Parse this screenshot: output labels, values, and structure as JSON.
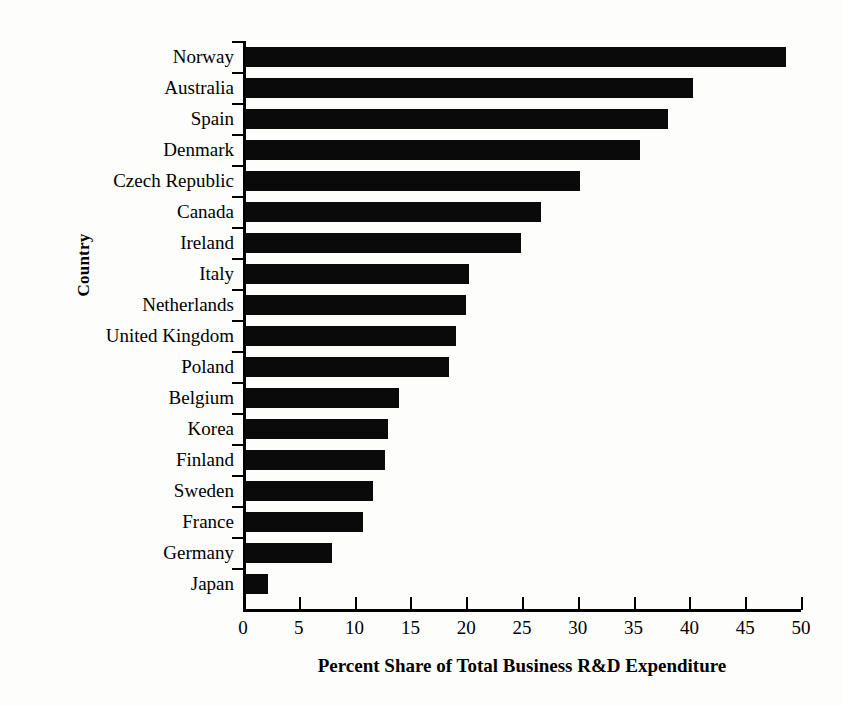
{
  "chart_data": {
    "type": "bar",
    "orientation": "horizontal",
    "title": "",
    "xlabel": "Percent Share of Total Business R&D Expenditure",
    "ylabel": "Country",
    "xlim": [
      0,
      50
    ],
    "xticks": [
      0,
      5,
      10,
      15,
      20,
      25,
      30,
      35,
      40,
      45,
      50
    ],
    "grid": false,
    "legend": false,
    "bar_color": "#0a0a0a",
    "background_color": "#fdfdfc",
    "categories": [
      "Norway",
      "Australia",
      "Spain",
      "Denmark",
      "Czech Republic",
      "Canada",
      "Ireland",
      "Italy",
      "Netherlands",
      "United Kingdom",
      "Poland",
      "Belgium",
      "Korea",
      "Finland",
      "Sweden",
      "France",
      "Germany",
      "Japan"
    ],
    "values": [
      48.5,
      40.1,
      37.9,
      35.4,
      30.0,
      26.5,
      24.7,
      20.1,
      19.8,
      18.9,
      18.3,
      13.8,
      12.8,
      12.5,
      11.5,
      10.6,
      7.8,
      2.1
    ]
  }
}
